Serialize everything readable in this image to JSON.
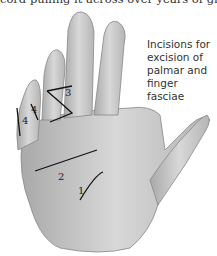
{
  "caption_top": "cord pulling it across over years of growth.",
  "figure": {
    "label_lines": [
      "Incisions for",
      "excision of",
      "palmar and",
      "finger fasciae"
    ],
    "incision_numbers": [
      "1",
      "2",
      "3",
      "4",
      "4"
    ]
  }
}
